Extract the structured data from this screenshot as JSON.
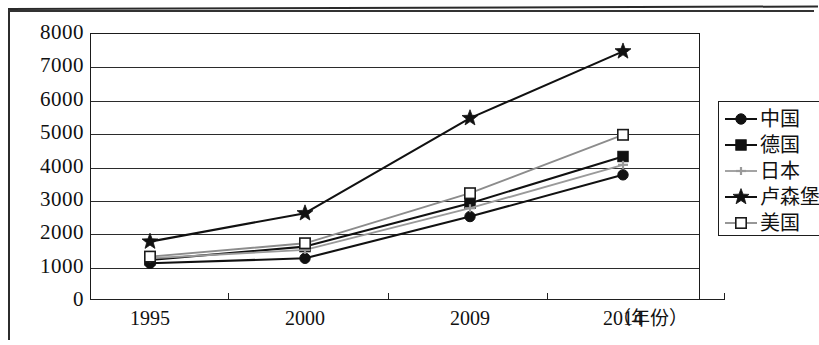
{
  "chart_data": {
    "type": "line",
    "title": "",
    "subtitle": "",
    "xlabel": "（年份）",
    "ylabel": "",
    "categories": [
      "1995",
      "2000",
      "2009",
      "2014"
    ],
    "ylim": [
      0,
      8000
    ],
    "ytick_labels": [
      "0",
      "1000",
      "2000",
      "3000",
      "4000",
      "5000",
      "6000",
      "7000",
      "8000"
    ],
    "ytick_values": [
      0,
      1000,
      2000,
      3000,
      4000,
      5000,
      6000,
      7000,
      8000
    ],
    "grid": true,
    "legend_position": "right",
    "series": [
      {
        "name": "中国",
        "marker": "filled-circle",
        "color": "#111111",
        "values": [
          1100,
          1250,
          2500,
          3750
        ]
      },
      {
        "name": "德国",
        "marker": "filled-square",
        "color": "#111111",
        "values": [
          1200,
          1600,
          2900,
          4300
        ]
      },
      {
        "name": "日本",
        "marker": "gray-cross",
        "color": "#9a9a9a",
        "values": [
          1250,
          1500,
          2750,
          4050
        ]
      },
      {
        "name": "卢森堡",
        "marker": "filled-star",
        "color": "#111111",
        "values": [
          1750,
          2600,
          5450,
          7450
        ]
      },
      {
        "name": "美国",
        "marker": "open-square",
        "color": "#8c8c8c",
        "values": [
          1300,
          1700,
          3200,
          4950
        ]
      }
    ]
  },
  "legend": {
    "entries": [
      {
        "label": "中国"
      },
      {
        "label": "德国"
      },
      {
        "label": "日本"
      },
      {
        "label": "卢森堡"
      },
      {
        "label": "美国"
      }
    ]
  },
  "axes": {
    "x_title": "（年份）"
  }
}
